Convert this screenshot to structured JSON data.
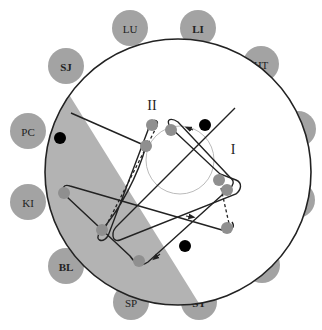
{
  "diagram": {
    "colors": {
      "node_fill": "#a3a3a3",
      "region_fill": "#b3b3b3",
      "outline": "#222222",
      "inner_circle": "#b8b8b8",
      "stop_fill": "#8f8f8f",
      "black_dot": "#000000"
    },
    "outer_nodes": [
      {
        "id": "LU",
        "label": "LU",
        "bold": false,
        "cx": 130,
        "cy": 28
      },
      {
        "id": "LI",
        "label": "LI",
        "bold": true,
        "cx": 198,
        "cy": 28
      },
      {
        "id": "HT",
        "label": "HT",
        "bold": false,
        "cx": 261,
        "cy": 64
      },
      {
        "id": "SJ",
        "label": "SJ",
        "bold": true,
        "cx": 66,
        "cy": 66
      },
      {
        "id": "SI",
        "label": "SI",
        "bold": true,
        "cx": 298,
        "cy": 129
      },
      {
        "id": "PC",
        "label": "PC",
        "bold": false,
        "cx": 28,
        "cy": 131
      },
      {
        "id": "GB",
        "label": "GB",
        "bold": true,
        "cx": 297,
        "cy": 200
      },
      {
        "id": "KI",
        "label": "KI",
        "bold": false,
        "cx": 28,
        "cy": 202
      },
      {
        "id": "LR",
        "label": "LR",
        "bold": false,
        "cx": 262,
        "cy": 265
      },
      {
        "id": "BL",
        "label": "BL",
        "bold": true,
        "cx": 66,
        "cy": 266
      },
      {
        "id": "SP",
        "label": "SP",
        "bold": false,
        "cx": 131,
        "cy": 302
      },
      {
        "id": "ST",
        "label": "ST",
        "bold": true,
        "cx": 199,
        "cy": 302
      }
    ],
    "loop_labels": [
      {
        "id": "loop-II",
        "label": "II",
        "x": 152,
        "y": 110
      },
      {
        "id": "loop-I",
        "label": "I",
        "x": 233,
        "y": 153
      }
    ]
  }
}
